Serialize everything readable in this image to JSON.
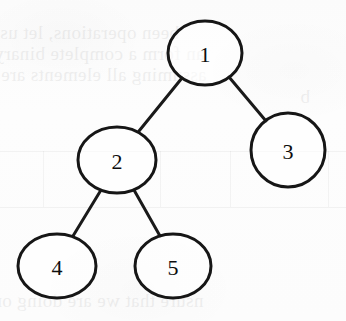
{
  "figure": {
    "kind": "binary-tree-diagram",
    "stroke_color": "#161616",
    "node_fill_color": "#ffffff",
    "background_color": "#fcfcfc"
  },
  "tree": {
    "nodes": [
      {
        "id": "1",
        "label": "1",
        "cx": 205,
        "cy": 53,
        "rx": 37,
        "ry": 32
      },
      {
        "id": "2",
        "label": "2",
        "cx": 117,
        "cy": 160,
        "rx": 39,
        "ry": 33
      },
      {
        "id": "3",
        "label": "3",
        "cx": 288,
        "cy": 150,
        "rx": 37,
        "ry": 37
      },
      {
        "id": "4",
        "label": "4",
        "cx": 57,
        "cy": 266,
        "rx": 39,
        "ry": 32
      },
      {
        "id": "5",
        "label": "5",
        "cx": 173,
        "cy": 266,
        "rx": 38,
        "ry": 32
      }
    ],
    "edges": [
      {
        "from": "1",
        "to": "2",
        "x1": 182,
        "y1": 78,
        "x2": 139,
        "y2": 131
      },
      {
        "from": "1",
        "to": "3",
        "x1": 229,
        "y1": 77,
        "x2": 266,
        "y2": 121
      },
      {
        "from": "2",
        "to": "4",
        "x1": 101,
        "y1": 190,
        "x2": 73,
        "y2": 236
      },
      {
        "from": "2",
        "to": "5",
        "x1": 134,
        "y1": 190,
        "x2": 160,
        "y2": 236
      }
    ]
  },
  "bleed_through": {
    "note": "faint reversed text and table rules showing through the page",
    "lines": [
      {
        "text": "been operations, let us a",
        "x": -14,
        "y": 22,
        "size": 19
      },
      {
        "text": "an form a complete binary",
        "x": -6,
        "y": 43,
        "size": 19
      },
      {
        "text": "assuming all elements are t",
        "x": -10,
        "y": 64,
        "size": 19
      },
      {
        "text": "b",
        "x": 300,
        "y": 86,
        "size": 19
      },
      {
        "text": "nsure that we are doing on",
        "x": -8,
        "y": 290,
        "size": 19
      }
    ],
    "rules_h": [
      {
        "x": 0,
        "y": 151,
        "w": 346
      },
      {
        "x": 0,
        "y": 207,
        "w": 346
      }
    ],
    "rules_v": [
      {
        "x": 43,
        "y": 151,
        "h": 56
      },
      {
        "x": 160,
        "y": 151,
        "h": 56
      },
      {
        "x": 230,
        "y": 151,
        "h": 56
      },
      {
        "x": 328,
        "y": 151,
        "h": 56
      }
    ]
  }
}
